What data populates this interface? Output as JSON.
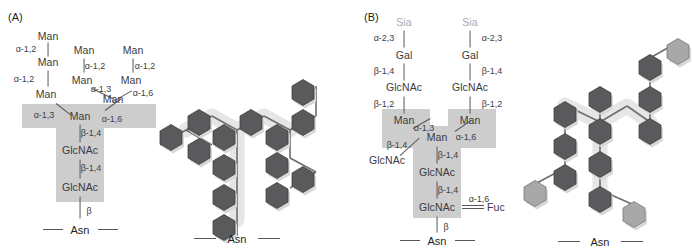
{
  "figure": {
    "background_color": "#ffffff",
    "panels": [
      {
        "id": "A",
        "label": "(A)",
        "type": "high-mannose-oligosaccharide"
      },
      {
        "id": "B",
        "label": "(B)",
        "type": "complex-oligosaccharide"
      }
    ]
  },
  "colors": {
    "text": "#3f3f42",
    "pale_text": "#a9a9ad",
    "bond": "#58585b",
    "core_shade": "#cdcdcd",
    "hex_dark": "#58585b",
    "hex_light": "#a8a8a8",
    "hex_stroke": "#3f3f42",
    "shadow": "#d6d6d6",
    "asn_text": "#231f20"
  },
  "panelA": {
    "label": "(A)",
    "asn": "Asn",
    "nodes": [
      {
        "name": "manA1",
        "label": "Man",
        "x": 48,
        "y": 36,
        "tone": "dark"
      },
      {
        "name": "manA2",
        "label": "Man",
        "x": 48,
        "y": 62,
        "tone": "dark"
      },
      {
        "name": "manA3",
        "label": "Man",
        "x": 46,
        "y": 94,
        "tone": "dark"
      },
      {
        "name": "manB1",
        "label": "Man",
        "x": 84,
        "y": 50,
        "tone": "dark"
      },
      {
        "name": "manB2",
        "label": "Man",
        "x": 82,
        "y": 80,
        "tone": "dark"
      },
      {
        "name": "manC1",
        "label": "Man",
        "x": 133,
        "y": 50,
        "tone": "dark"
      },
      {
        "name": "manC2",
        "label": "Man",
        "x": 131,
        "y": 80,
        "tone": "dark"
      },
      {
        "name": "manBr",
        "label": "Man",
        "x": 113,
        "y": 99,
        "tone": "dark"
      },
      {
        "name": "manCore",
        "label": "Man",
        "x": 80,
        "y": 116,
        "tone": "dark"
      },
      {
        "name": "glcnac1",
        "label": "GlcNAc",
        "x": 80,
        "y": 150,
        "tone": "dark"
      },
      {
        "name": "glcnac2",
        "label": "GlcNAc",
        "x": 80,
        "y": 187,
        "tone": "dark"
      }
    ],
    "links": [
      {
        "name": "a12-1",
        "label": "α-1,2",
        "x": 26,
        "y": 49
      },
      {
        "name": "a12-2",
        "label": "α-1,2",
        "x": 24,
        "y": 79
      },
      {
        "name": "a13-1",
        "label": "α-1,3",
        "x": 44,
        "y": 115
      },
      {
        "name": "a12-3",
        "label": "α-1,2",
        "x": 95,
        "y": 66
      },
      {
        "name": "a13-2",
        "label": "α-1,3",
        "x": 101,
        "y": 89
      },
      {
        "name": "a12-4",
        "label": "α-1,2",
        "x": 145,
        "y": 66
      },
      {
        "name": "a16-1",
        "label": "α-1,6",
        "x": 143,
        "y": 93
      },
      {
        "name": "a16-2",
        "label": "α-1,6",
        "x": 112,
        "y": 119
      },
      {
        "name": "b14-1",
        "label": "β-1,4",
        "x": 91,
        "y": 133
      },
      {
        "name": "b14-2",
        "label": "β-1,4",
        "x": 91,
        "y": 168
      },
      {
        "name": "beta",
        "label": "β",
        "x": 89,
        "y": 211
      }
    ]
  },
  "panelB": {
    "label": "(B)",
    "asn": "Asn",
    "nodes": [
      {
        "name": "sia-left",
        "label": "Sia",
        "x": 404,
        "y": 22,
        "tone": "pale"
      },
      {
        "name": "gal-left",
        "label": "Gal",
        "x": 404,
        "y": 55,
        "tone": "dark"
      },
      {
        "name": "glcnac-left",
        "label": "GlcNAc",
        "x": 404,
        "y": 87,
        "tone": "dark"
      },
      {
        "name": "man-left",
        "label": "Man",
        "x": 404,
        "y": 120,
        "tone": "dark"
      },
      {
        "name": "sia-right",
        "label": "Sia",
        "x": 470,
        "y": 22,
        "tone": "pale"
      },
      {
        "name": "gal-right",
        "label": "Gal",
        "x": 470,
        "y": 55,
        "tone": "dark"
      },
      {
        "name": "glcnac-right",
        "label": "GlcNAc",
        "x": 470,
        "y": 87,
        "tone": "dark"
      },
      {
        "name": "man-right",
        "label": "Man",
        "x": 470,
        "y": 120,
        "tone": "dark"
      },
      {
        "name": "man-core",
        "label": "Man",
        "x": 437,
        "y": 137,
        "tone": "dark"
      },
      {
        "name": "glcnac-bisect",
        "label": "GlcNAc",
        "x": 387,
        "y": 160,
        "tone": "dark"
      },
      {
        "name": "glcnac-core1",
        "label": "GlcNAc",
        "x": 437,
        "y": 172,
        "tone": "dark"
      },
      {
        "name": "glcnac-core2",
        "label": "GlcNAc",
        "x": 437,
        "y": 207,
        "tone": "dark"
      },
      {
        "name": "fuc",
        "label": "Fuc",
        "x": 496,
        "y": 207,
        "tone": "dark"
      }
    ],
    "links": [
      {
        "name": "a23-left",
        "label": "α-2,3",
        "x": 384,
        "y": 38
      },
      {
        "name": "b14-left",
        "label": "β-1,4",
        "x": 384,
        "y": 71
      },
      {
        "name": "b12-left",
        "label": "β-1,2",
        "x": 384,
        "y": 104
      },
      {
        "name": "a23-right",
        "label": "α-2,3",
        "x": 492,
        "y": 38
      },
      {
        "name": "b14-right",
        "label": "β-1,4",
        "x": 492,
        "y": 71
      },
      {
        "name": "b12-right",
        "label": "β-1,2",
        "x": 492,
        "y": 104
      },
      {
        "name": "a13-core",
        "label": "α-1,3",
        "x": 424,
        "y": 128
      },
      {
        "name": "a16-core",
        "label": "α-1,6",
        "x": 466,
        "y": 137
      },
      {
        "name": "b14-bisect",
        "label": "β-1,4",
        "x": 397,
        "y": 145
      },
      {
        "name": "b14-c1",
        "label": "β-1,4",
        "x": 448,
        "y": 155
      },
      {
        "name": "b14-c2",
        "label": "β-1,4",
        "x": 448,
        "y": 190
      },
      {
        "name": "a16-fuc",
        "label": "α-1,6",
        "x": 479,
        "y": 199
      },
      {
        "name": "beta-b",
        "label": "β",
        "x": 446,
        "y": 227
      }
    ]
  },
  "symbolA": {
    "name": "high-mannose-symbol-diagram",
    "asn": "Asn",
    "hexagons": [
      {
        "name": "hex-man-a1",
        "cx": 186,
        "cy": 130,
        "tone": "dark"
      },
      {
        "name": "hex-man-a2",
        "cx": 212,
        "cy": 145,
        "tone": "dark"
      },
      {
        "name": "hex-man-a3",
        "cx": 212,
        "cy": 116,
        "tone": "dark"
      },
      {
        "name": "hex-man-core",
        "cx": 237,
        "cy": 130,
        "tone": "dark"
      },
      {
        "name": "hex-man-b1",
        "cx": 290,
        "cy": 100,
        "tone": "dark"
      },
      {
        "name": "hex-man-b2",
        "cx": 316,
        "cy": 116,
        "tone": "dark"
      },
      {
        "name": "hex-man-c1",
        "cx": 290,
        "cy": 130,
        "tone": "dark"
      },
      {
        "name": "hex-man-c2",
        "cx": 316,
        "cy": 160,
        "tone": "dark"
      },
      {
        "name": "hex-man-c3",
        "cx": 290,
        "cy": 176,
        "tone": "dark"
      },
      {
        "name": "hex-man-mid",
        "cx": 237,
        "cy": 160,
        "tone": "dark"
      },
      {
        "name": "hex-glcnac-1",
        "cx": 237,
        "cy": 190,
        "tone": "dark"
      },
      {
        "name": "hex-glcnac-2",
        "cx": 237,
        "cy": 220,
        "tone": "dark"
      }
    ]
  },
  "symbolB": {
    "name": "complex-symbol-diagram",
    "asn": "Asn",
    "hexagons": [
      {
        "name": "hex-b-sia-r",
        "cx": 668,
        "cy": 42,
        "tone": "light"
      },
      {
        "name": "hex-b-gal-r",
        "cx": 638,
        "cy": 58,
        "tone": "dark"
      },
      {
        "name": "hex-b-glcnac-r",
        "cx": 638,
        "cy": 90,
        "tone": "dark"
      },
      {
        "name": "hex-b-man-r",
        "cx": 638,
        "cy": 122,
        "tone": "dark"
      },
      {
        "name": "hex-b-man-l",
        "cx": 565,
        "cy": 105,
        "tone": "dark"
      },
      {
        "name": "hex-b-glcnac-l",
        "cx": 565,
        "cy": 137,
        "tone": "dark"
      },
      {
        "name": "hex-b-gal-l",
        "cx": 565,
        "cy": 168,
        "tone": "dark"
      },
      {
        "name": "hex-b-sia-l",
        "cx": 535,
        "cy": 184,
        "tone": "light"
      },
      {
        "name": "hex-b-bisect",
        "cx": 600,
        "cy": 90,
        "tone": "dark"
      },
      {
        "name": "hex-b-man-core",
        "cx": 600,
        "cy": 122,
        "tone": "dark"
      },
      {
        "name": "hex-b-glcnac-1",
        "cx": 600,
        "cy": 155,
        "tone": "dark"
      },
      {
        "name": "hex-b-glcnac-2",
        "cx": 600,
        "cy": 190,
        "tone": "dark"
      },
      {
        "name": "hex-b-fuc",
        "cx": 634,
        "cy": 205,
        "tone": "light"
      }
    ]
  }
}
